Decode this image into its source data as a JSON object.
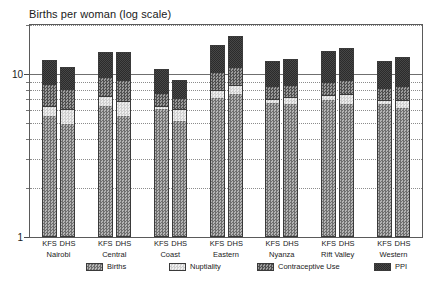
{
  "chart_data": {
    "type": "bar",
    "subtype": "stacked-bar",
    "title": "Births per woman (log scale)",
    "xlabel": "",
    "ylabel": "",
    "yscale": "log",
    "ylim": [
      1,
      20
    ],
    "grid": true,
    "legend_position": "bottom",
    "y_ticks": [
      {
        "value": 10,
        "label": "10",
        "major": true
      },
      {
        "value": 1,
        "label": "1",
        "major": true
      }
    ],
    "y_minor_ticks": [
      2,
      3,
      4,
      5,
      6,
      7,
      8,
      9,
      20
    ],
    "groups": [
      "Nairobi",
      "Central",
      "Coast",
      "Eastern",
      "Nyanza",
      "Rift Valley",
      "Western"
    ],
    "subcategories": [
      "KFS",
      "DHS"
    ],
    "series": [
      {
        "name": "Births",
        "color": "#8d8d8d",
        "pattern": "checker-medium",
        "values": [
          4.6,
          4.0,
          5.5,
          4.6,
          5.2,
          4.2,
          6.2,
          6.6,
          5.7,
          5.6,
          6.0,
          5.6,
          5.6,
          5.3
        ]
      },
      {
        "name": "Nuptiality",
        "color": "#dcdcdc",
        "pattern": "checker-light",
        "values": [
          0.85,
          1.15,
          0.95,
          1.35,
          0.3,
          0.95,
          0.85,
          1.05,
          0.45,
          0.75,
          0.55,
          1.05,
          0.4,
          0.7
        ]
      },
      {
        "name": "Contraceptive Use",
        "color": "#757575",
        "pattern": "checker-dark",
        "values": [
          2.35,
          2.05,
          2.3,
          2.35,
          1.3,
          1.1,
          2.45,
          2.6,
          1.4,
          1.3,
          1.55,
          1.65,
          1.35,
          1.55
        ]
      },
      {
        "name": "PPI",
        "color": "#3a3a3a",
        "pattern": "solid-dark",
        "values": [
          4.4,
          3.9,
          4.9,
          5.3,
          3.9,
          2.9,
          5.6,
          6.8,
          4.5,
          4.7,
          5.7,
          6.2,
          4.6,
          5.1
        ]
      }
    ],
    "bar_totals": [
      12.2,
      11.1,
      13.65,
      13.6,
      10.7,
      9.15,
      15.1,
      17.05,
      12.05,
      12.35,
      13.8,
      14.5,
      11.95,
      12.65
    ]
  },
  "axis": {
    "y_label_top": "10",
    "y_label_bottom": "1"
  },
  "legend": {
    "items": [
      {
        "label": "Births",
        "swatch": "fill-births"
      },
      {
        "label": "Nuptiality",
        "swatch": "fill-nuptiality"
      },
      {
        "label": "Contraceptive Use",
        "swatch": "fill-contraceptive"
      },
      {
        "label": "PPI",
        "swatch": "fill-ppi"
      }
    ]
  }
}
